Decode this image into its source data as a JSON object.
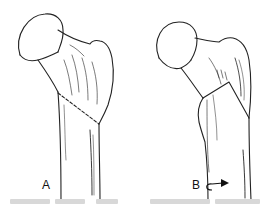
{
  "figure": {
    "panels": [
      {
        "id": "A",
        "label": "A",
        "description": "proximal femur with oblique dashed fracture line"
      },
      {
        "id": "B",
        "label": "B",
        "description": "proximal femur with inverted-V fracture and rotation arrow"
      }
    ],
    "rotation_icon": "curved-rotation-arrow-icon",
    "caption_visible": false
  }
}
